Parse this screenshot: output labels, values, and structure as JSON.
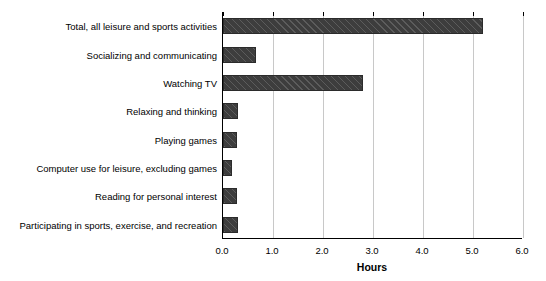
{
  "chart_data": {
    "type": "bar",
    "orientation": "horizontal",
    "title": "",
    "xlabel": "Hours",
    "ylabel": "",
    "xlim": [
      0.0,
      6.0
    ],
    "xticks": [
      "0.0",
      "1.0",
      "2.0",
      "3.0",
      "4.0",
      "5.0",
      "6.0"
    ],
    "xtick_values": [
      0.0,
      1.0,
      2.0,
      3.0,
      4.0,
      5.0,
      6.0
    ],
    "grid": "vertical",
    "legend": "none",
    "bar_color": "#3d3d3d",
    "bar_hatch": "diagonal",
    "categories": [
      "Total, all leisure and sports activities",
      "Socializing and communicating",
      "Watching TV",
      "Relaxing and thinking",
      "Playing games",
      "Computer use for leisure, excluding games",
      "Reading for personal interest",
      "Participating in sports, exercise, and recreation"
    ],
    "values": [
      5.2,
      0.65,
      2.8,
      0.3,
      0.27,
      0.17,
      0.27,
      0.3
    ]
  }
}
